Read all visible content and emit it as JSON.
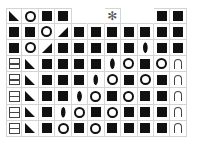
{
  "board": {
    "columns": 11,
    "rows": [
      [
        "tri-bl",
        "circle",
        "square",
        "square",
        "",
        "",
        "star",
        "",
        "",
        "square",
        "square"
      ],
      [
        "square",
        "square",
        "circle",
        "tri-br",
        "square",
        "square",
        "square",
        "square",
        "square",
        "square",
        "square"
      ],
      [
        "square",
        "circle",
        "tri-br",
        "square",
        "square",
        "square",
        "square",
        "square",
        "lens",
        "square",
        "square"
      ],
      [
        "bar",
        "tri-bl",
        "square",
        "square",
        "square",
        "square",
        "lens",
        "circle",
        "square",
        "circle",
        "arch"
      ],
      [
        "bar",
        "tri-bl",
        "square",
        "square",
        "square",
        "lens",
        "circle",
        "square",
        "circle",
        "square",
        "arch"
      ],
      [
        "bar",
        "tri-bl",
        "square",
        "square",
        "lens",
        "circle",
        "square",
        "circle",
        "square",
        "square",
        "arch"
      ],
      [
        "bar",
        "tri-bl",
        "square",
        "lens",
        "circle",
        "square",
        "circle",
        "square",
        "square",
        "square",
        "arch"
      ],
      [
        "bar",
        "tri-bl",
        "square",
        "circle",
        "square",
        "circle",
        "square",
        "square",
        "square",
        "square",
        "arch"
      ]
    ],
    "special_glyph": "✻"
  },
  "colors": {
    "tile": "#111111",
    "grid": "#d4d4d4",
    "special": "#555555"
  }
}
